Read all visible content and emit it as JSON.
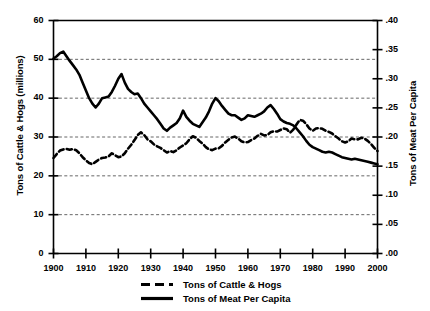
{
  "chart_data": {
    "type": "line",
    "title": "",
    "xlabel": "",
    "ylabel": "Tons of Cattle & Hogs (millions)",
    "ylabel_right": "Tons of Meat Per Capita",
    "xlim": [
      1900,
      2000
    ],
    "ylim": [
      0,
      60
    ],
    "ylim_right": [
      0.0,
      0.4
    ],
    "grid": true,
    "legend_position": "bottom",
    "x_ticks": [
      "1900",
      "1910",
      "1920",
      "1930",
      "1940",
      "1950",
      "1960",
      "1970",
      "1980",
      "1990",
      "2000"
    ],
    "y_ticks_left": [
      "0",
      "10",
      "20",
      "30",
      "40",
      "50",
      "60"
    ],
    "y_ticks_right": [
      ".00",
      ".05",
      ".10",
      ".15",
      ".20",
      ".25",
      ".30",
      ".35",
      ".40"
    ],
    "x": [
      1900,
      1901,
      1902,
      1903,
      1904,
      1905,
      1906,
      1907,
      1908,
      1909,
      1910,
      1911,
      1912,
      1913,
      1914,
      1915,
      1916,
      1917,
      1918,
      1919,
      1920,
      1921,
      1922,
      1923,
      1924,
      1925,
      1926,
      1927,
      1928,
      1929,
      1930,
      1931,
      1932,
      1933,
      1934,
      1935,
      1936,
      1937,
      1938,
      1939,
      1940,
      1941,
      1942,
      1943,
      1944,
      1945,
      1946,
      1947,
      1948,
      1949,
      1950,
      1951,
      1952,
      1953,
      1954,
      1955,
      1956,
      1957,
      1958,
      1959,
      1960,
      1961,
      1962,
      1963,
      1964,
      1965,
      1966,
      1967,
      1968,
      1969,
      1970,
      1971,
      1972,
      1973,
      1974,
      1975,
      1976,
      1977,
      1978,
      1979,
      1980,
      1981,
      1982,
      1983,
      1984,
      1985,
      1986,
      1987,
      1988,
      1989,
      1990,
      1991,
      1992,
      1993,
      1994,
      1995,
      1996,
      1997,
      1998,
      1999,
      2000
    ],
    "series": [
      {
        "name": "Tons of Cattle & Hogs",
        "style": "dashed",
        "axis": "left",
        "units": "millions of tons",
        "values": [
          24.6,
          25.6,
          26.5,
          26.8,
          26.9,
          26.7,
          26.9,
          26.6,
          25.8,
          24.8,
          24.0,
          23.3,
          23.0,
          23.6,
          24.2,
          24.6,
          24.7,
          25.0,
          25.8,
          25.3,
          24.8,
          25.0,
          25.8,
          27.0,
          28.0,
          29.2,
          30.5,
          31.2,
          30.5,
          29.4,
          28.9,
          28.1,
          27.6,
          27.2,
          26.6,
          26.0,
          26.4,
          26.1,
          26.6,
          27.3,
          27.8,
          28.4,
          29.4,
          30.2,
          29.8,
          29.0,
          28.3,
          27.4,
          26.8,
          26.6,
          27.0,
          27.1,
          27.7,
          28.6,
          29.3,
          29.9,
          30.1,
          29.6,
          28.9,
          28.6,
          28.7,
          29.2,
          29.6,
          30.3,
          30.8,
          30.4,
          30.5,
          31.2,
          31.5,
          31.4,
          31.8,
          32.2,
          32.0,
          31.1,
          31.9,
          33.2,
          34.4,
          34.2,
          33.3,
          32.2,
          31.6,
          32.2,
          32.3,
          32.1,
          31.6,
          31.3,
          30.9,
          30.2,
          29.6,
          28.9,
          28.6,
          28.9,
          29.6,
          29.4,
          29.4,
          29.8,
          29.6,
          29.0,
          28.2,
          27.2,
          26.4
        ]
      },
      {
        "name": "Tons of Meat Per Capita",
        "style": "solid",
        "axis": "right",
        "units": "tons per capita",
        "values_left_scale": [
          50.2,
          50.8,
          51.6,
          52.0,
          50.8,
          49.6,
          48.5,
          47.4,
          46.0,
          44.0,
          42.0,
          40.0,
          38.6,
          37.6,
          38.6,
          40.0,
          40.2,
          40.4,
          41.6,
          43.2,
          45.0,
          46.2,
          44.0,
          42.4,
          41.6,
          41.0,
          41.2,
          40.0,
          38.6,
          37.6,
          36.6,
          35.6,
          34.6,
          33.4,
          32.2,
          31.6,
          32.4,
          33.0,
          33.6,
          34.8,
          36.8,
          35.2,
          34.2,
          33.4,
          33.0,
          32.6,
          33.8,
          35.0,
          36.6,
          38.6,
          40.0,
          39.2,
          38.0,
          37.0,
          36.0,
          35.6,
          35.6,
          35.0,
          34.4,
          34.8,
          35.6,
          35.4,
          35.2,
          35.6,
          36.0,
          36.6,
          37.6,
          38.2,
          37.2,
          36.0,
          34.6,
          34.0,
          33.6,
          33.4,
          33.0,
          32.2,
          31.2,
          30.2,
          29.0,
          28.0,
          27.4,
          27.0,
          26.6,
          26.2,
          26.0,
          26.2,
          26.0,
          25.6,
          25.2,
          24.8,
          24.6,
          24.4,
          24.2,
          24.4,
          24.2,
          24.0,
          23.8,
          23.6,
          23.4,
          23.2,
          23.0
        ],
        "values": [
          0.335,
          0.339,
          0.344,
          0.347,
          0.339,
          0.331,
          0.323,
          0.316,
          0.307,
          0.293,
          0.28,
          0.267,
          0.257,
          0.251,
          0.257,
          0.267,
          0.268,
          0.269,
          0.277,
          0.288,
          0.3,
          0.308,
          0.293,
          0.283,
          0.277,
          0.273,
          0.275,
          0.267,
          0.257,
          0.251,
          0.244,
          0.237,
          0.231,
          0.223,
          0.215,
          0.211,
          0.216,
          0.22,
          0.224,
          0.232,
          0.245,
          0.235,
          0.228,
          0.223,
          0.22,
          0.217,
          0.225,
          0.233,
          0.244,
          0.257,
          0.267,
          0.261,
          0.253,
          0.247,
          0.24,
          0.237,
          0.237,
          0.233,
          0.229,
          0.232,
          0.237,
          0.236,
          0.235,
          0.237,
          0.24,
          0.244,
          0.251,
          0.255,
          0.248,
          0.24,
          0.231,
          0.227,
          0.224,
          0.223,
          0.22,
          0.215,
          0.208,
          0.201,
          0.193,
          0.187,
          0.183,
          0.18,
          0.177,
          0.175,
          0.173,
          0.175,
          0.173,
          0.171,
          0.168,
          0.165,
          0.164,
          0.163,
          0.161,
          0.163,
          0.161,
          0.16,
          0.159,
          0.157,
          0.156,
          0.155,
          0.153
        ]
      }
    ]
  },
  "legend": {
    "items": [
      {
        "label": "Tons of Cattle & Hogs",
        "style": "dashed"
      },
      {
        "label": "Tons of Meat Per Capita",
        "style": "solid"
      }
    ]
  },
  "colors": {
    "line": "#000000",
    "grid": "#555555",
    "axis": "#000000",
    "background": "#ffffff"
  }
}
